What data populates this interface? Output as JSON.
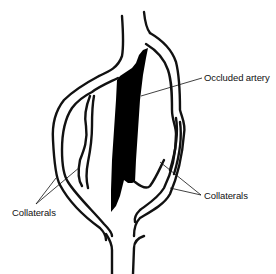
{
  "diagram": {
    "labels": {
      "occluded": "Occluded artery",
      "collaterals_left": "Collaterals",
      "collaterals_right": "Collaterals"
    },
    "colors": {
      "stroke": "#111111",
      "occlusion_fill": "#000000",
      "background": "#ffffff"
    }
  }
}
